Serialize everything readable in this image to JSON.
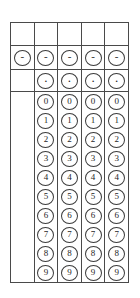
{
  "sheet": {
    "title": "numeric-answer-bubble-grid",
    "columns": 5,
    "ink_color": "#3b3b3b",
    "background_color": "#ffffff",
    "rows": {
      "header_label": "",
      "sign_label": "-",
      "decimal_label": "."
    },
    "sign_row": {
      "name": "minus-sign-row",
      "cells": [
        {
          "label": "-",
          "present": true
        },
        {
          "label": "-",
          "present": true
        },
        {
          "label": "-",
          "present": true
        },
        {
          "label": "-",
          "present": true
        },
        {
          "label": "-",
          "present": true
        }
      ]
    },
    "decimal_row": {
      "name": "decimal-point-row",
      "cells": [
        {
          "label": ".",
          "present": false
        },
        {
          "label": ".",
          "present": true
        },
        {
          "label": ".",
          "present": true
        },
        {
          "label": ".",
          "present": true
        },
        {
          "label": ".",
          "present": true
        }
      ]
    },
    "header_row": {
      "name": "answer-write-in-row",
      "cells": [
        {
          "label": "",
          "present": false
        },
        {
          "label": "",
          "present": false
        },
        {
          "label": "",
          "present": false
        },
        {
          "label": "",
          "present": false
        },
        {
          "label": "",
          "present": false
        }
      ]
    },
    "digits": [
      "0",
      "1",
      "2",
      "3",
      "4",
      "5",
      "6",
      "7",
      "8",
      "9"
    ],
    "digit_columns": [
      {
        "name": "digit-column-1"
      },
      {
        "name": "digit-column-2"
      },
      {
        "name": "digit-column-3"
      },
      {
        "name": "digit-column-4"
      }
    ]
  }
}
